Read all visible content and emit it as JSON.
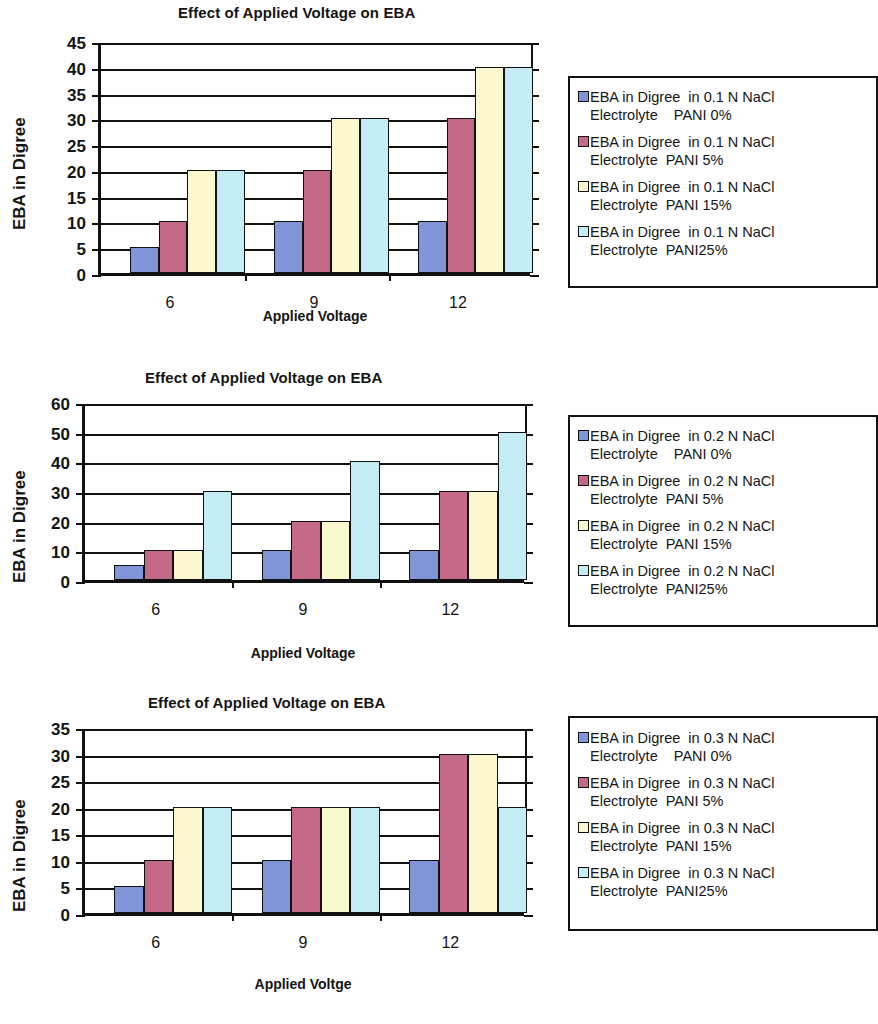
{
  "colors": {
    "series_blue": "#8095d8",
    "series_rose": "#c46a88",
    "series_cream": "#fbf7cf",
    "series_cyan": "#c3ecf4",
    "axis": "#111111",
    "text": "#141414",
    "background": "#ffffff"
  },
  "charts": [
    {
      "title": "Effect of Applied Voltage on EBA",
      "ylabel": "EBA in Digree",
      "xlabel": "Applied Voltage",
      "ytick_labels": [
        "45",
        "40",
        "35",
        "30",
        "25",
        "20",
        "15",
        "10",
        "5",
        "0"
      ],
      "xtick_labels": [
        "6",
        "9",
        "12"
      ],
      "legend": [
        "EBA in Digree  in 0.1 N NaCl\nElectrolyte    PANI 0%",
        "EBA in Digree  in 0.1 N NaCl\nElectrolyte  PANI 5%",
        "EBA in Digree  in 0.1 N NaCl\nElectrolyte  PANI 15%",
        "EBA in Digree  in 0.1 N NaCl\nElectrolyte  PANI25%"
      ]
    },
    {
      "title": "Effect of Applied Voltage on EBA",
      "ylabel": "EBA in Digree",
      "xlabel": "Applied Voltage",
      "ytick_labels": [
        "60",
        "50",
        "40",
        "30",
        "20",
        "10",
        "0"
      ],
      "xtick_labels": [
        "6",
        "9",
        "12"
      ],
      "legend": [
        "EBA in Digree  in 0.2 N NaCl\nElectrolyte    PANI 0%",
        "EBA in Digree  in 0.2 N NaCl\nElectrolyte  PANI 5%",
        "EBA in Digree  in 0.2 N NaCl\nElectrolyte  PANI 15%",
        "EBA in Digree  in 0.2 N NaCl\nElectrolyte  PANI25%"
      ]
    },
    {
      "title": "Effect of Applied Voltage on EBA",
      "ylabel": "EBA in Digree",
      "xlabel": "Applied Voltge",
      "ytick_labels": [
        "35",
        "30",
        "25",
        "20",
        "15",
        "10",
        "5",
        "0"
      ],
      "xtick_labels": [
        "6",
        "9",
        "12"
      ],
      "legend": [
        "EBA in Digree  in 0.3 N NaCl\nElectrolyte    PANI 0%",
        "EBA in Digree  in 0.3 N NaCl\nElectrolyte  PANI 5%",
        "EBA in Digree  in 0.3 N NaCl\nElectrolyte  PANI 15%",
        "EBA in Digree  in 0.3 N NaCl\nElectrolyte  PANI25%"
      ]
    }
  ],
  "chart_data": [
    {
      "type": "bar",
      "title": "Effect of Applied Voltage on EBA",
      "xlabel": "Applied Voltage",
      "ylabel": "EBA in Digree",
      "categories": [
        "6",
        "9",
        "12"
      ],
      "ylim": [
        0,
        45
      ],
      "ytick_step": 5,
      "grid": true,
      "legend_position": "right",
      "series": [
        {
          "name": "EBA in Digree  in 0.1 N NaCl Electrolyte    PANI 0%",
          "color": "#8095d8",
          "values": [
            5,
            10,
            10
          ]
        },
        {
          "name": "EBA in Digree  in 0.1 N NaCl Electrolyte  PANI 5%",
          "color": "#c46a88",
          "values": [
            10,
            20,
            30
          ]
        },
        {
          "name": "EBA in Digree  in 0.1 N NaCl Electrolyte  PANI 15%",
          "color": "#fbf7cf",
          "values": [
            20,
            30,
            40
          ]
        },
        {
          "name": "EBA in Digree  in 0.1 N NaCl Electrolyte  PANI25%",
          "color": "#c3ecf4",
          "values": [
            20,
            30,
            40
          ]
        }
      ]
    },
    {
      "type": "bar",
      "title": "Effect of Applied Voltage on EBA",
      "xlabel": "Applied Voltage",
      "ylabel": "EBA in Digree",
      "categories": [
        "6",
        "9",
        "12"
      ],
      "ylim": [
        0,
        60
      ],
      "ytick_step": 10,
      "grid": true,
      "legend_position": "right",
      "series": [
        {
          "name": "EBA in Digree  in 0.2 N NaCl Electrolyte    PANI 0%",
          "color": "#8095d8",
          "values": [
            5,
            10,
            10
          ]
        },
        {
          "name": "EBA in Digree  in 0.2 N NaCl Electrolyte  PANI 5%",
          "color": "#c46a88",
          "values": [
            10,
            20,
            30
          ]
        },
        {
          "name": "EBA in Digree  in 0.2 N NaCl Electrolyte  PANI 15%",
          "color": "#fbf7cf",
          "values": [
            10,
            20,
            30
          ]
        },
        {
          "name": "EBA in Digree  in 0.2 N NaCl Electrolyte  PANI25%",
          "color": "#c3ecf4",
          "values": [
            30,
            40,
            50
          ]
        }
      ]
    },
    {
      "type": "bar",
      "title": "Effect of Applied Voltage on EBA",
      "xlabel": "Applied Voltge",
      "ylabel": "EBA in Digree",
      "categories": [
        "6",
        "9",
        "12"
      ],
      "ylim": [
        0,
        35
      ],
      "ytick_step": 5,
      "grid": true,
      "legend_position": "right",
      "series": [
        {
          "name": "EBA in Digree  in 0.3 N NaCl Electrolyte    PANI 0%",
          "color": "#8095d8",
          "values": [
            5,
            10,
            10
          ]
        },
        {
          "name": "EBA in Digree  in 0.3 N NaCl Electrolyte  PANI 5%",
          "color": "#c46a88",
          "values": [
            10,
            20,
            30
          ]
        },
        {
          "name": "EBA in Digree  in 0.3 N NaCl Electrolyte  PANI 15%",
          "color": "#fbf7cf",
          "values": [
            20,
            20,
            30
          ]
        },
        {
          "name": "EBA in Digree  in 0.3 N NaCl Electrolyte  PANI25%",
          "color": "#c3ecf4",
          "values": [
            20,
            20,
            20
          ]
        }
      ]
    }
  ]
}
